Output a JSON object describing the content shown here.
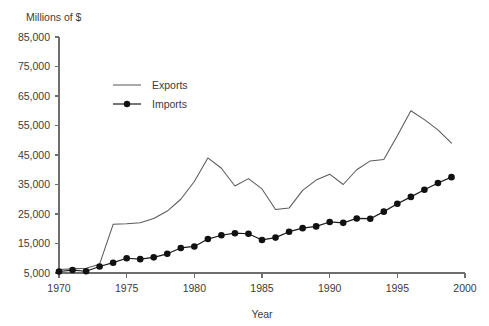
{
  "chart_data": {
    "type": "line",
    "title": "",
    "subtitle": "",
    "ylabel": "Millions of $",
    "xlabel": "Year",
    "grid": false,
    "legend_position": "upper-left-inside",
    "xlim": [
      1970,
      2000
    ],
    "ylim": [
      5000,
      85000
    ],
    "y_ticks": [
      5000,
      15000,
      25000,
      35000,
      45000,
      55000,
      65000,
      75000,
      85000
    ],
    "y_tick_labels": [
      "5,000",
      "15,000",
      "25,000",
      "35,000",
      "45,000",
      "55,000",
      "65,000",
      "75,000",
      "85,000"
    ],
    "x_ticks": [
      1970,
      1975,
      1980,
      1985,
      1990,
      1995,
      2000
    ],
    "x_tick_labels": [
      "1970",
      "1975",
      "1980",
      "1985",
      "1990",
      "1995",
      "2000"
    ],
    "x": [
      1970,
      1971,
      1972,
      1973,
      1974,
      1975,
      1976,
      1977,
      1978,
      1979,
      1980,
      1981,
      1982,
      1983,
      1984,
      1985,
      1986,
      1987,
      1988,
      1989,
      1990,
      1991,
      1992,
      1993,
      1994,
      1995,
      1996,
      1997,
      1998,
      1999
    ],
    "series": [
      {
        "name": "Exports",
        "marker": "none",
        "color": "#5a5a5a",
        "values": [
          6200,
          6400,
          6600,
          8000,
          21500,
          21700,
          22000,
          23500,
          26000,
          30000,
          36000,
          44000,
          40500,
          34500,
          37000,
          33500,
          26500,
          27000,
          33000,
          36500,
          38500,
          35000,
          40000,
          43000,
          43500,
          51500,
          60000,
          57000,
          53500,
          49000
        ]
      },
      {
        "name": "Imports",
        "marker": "circle",
        "color": "#111111",
        "values": [
          5500,
          6000,
          5600,
          7200,
          8500,
          10000,
          9700,
          10300,
          11500,
          13500,
          14000,
          16500,
          17800,
          18500,
          18300,
          16200,
          17000,
          19000,
          20200,
          20800,
          22300,
          22000,
          23500,
          23400,
          25800,
          28500,
          30800,
          33200,
          35500,
          37500
        ]
      }
    ],
    "annotations": []
  },
  "legend": {
    "items": [
      {
        "label": "Exports",
        "style": "line"
      },
      {
        "label": "Imports",
        "style": "line-marker"
      }
    ]
  },
  "axes": {
    "y_title": "Millions of $",
    "x_title": "Year"
  },
  "colors": {
    "background": "#ffffff",
    "axis": "#6e6e6e",
    "text": "#3b3b3b",
    "exports": "#5a5a5a",
    "imports": "#111111"
  }
}
